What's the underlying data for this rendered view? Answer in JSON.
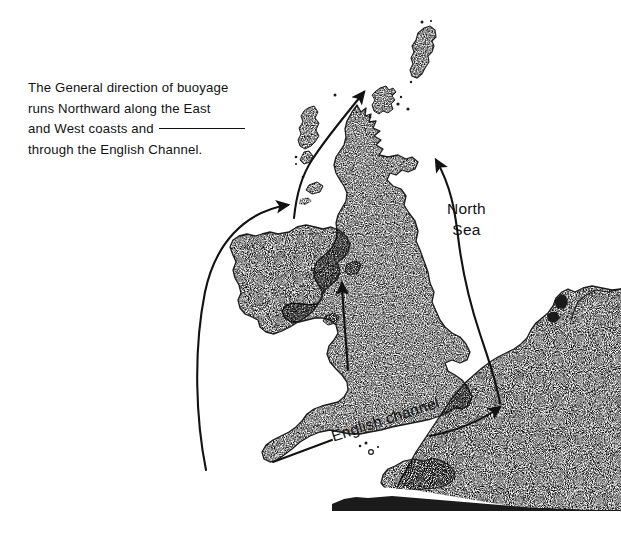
{
  "figure": {
    "background_color": "#ffffff",
    "ink_color": "#121212"
  },
  "caption": {
    "line1": "The General direction of buoyage",
    "line2": "runs Northward along the East",
    "line3_before_rule": "and West coasts and",
    "line4": "through the English Channel."
  },
  "map_labels": {
    "north_sea_line1": "North",
    "north_sea_line2": "Sea",
    "english_channel": "English channel"
  },
  "landmasses": [
    {
      "name": "shetland-islands",
      "label": "Shetland Islands"
    },
    {
      "name": "orkney-islands",
      "label": "Orkney Islands"
    },
    {
      "name": "outer-hebrides",
      "label": "Outer Hebrides"
    },
    {
      "name": "great-britain",
      "label": "Great Britain"
    },
    {
      "name": "ireland",
      "label": "Ireland"
    },
    {
      "name": "isle-of-man",
      "label": "Isle of Man"
    },
    {
      "name": "anglesey",
      "label": "Anglesey"
    },
    {
      "name": "channel-islands",
      "label": "Channel Islands"
    },
    {
      "name": "continental-europe",
      "label": "Continental Europe"
    }
  ],
  "arrows": [
    {
      "name": "west-coast-buoyage-arrow",
      "direction": "northward",
      "region": "Atlantic / west of Ireland and Scotland"
    },
    {
      "name": "irish-sea-buoyage-arrow",
      "direction": "northward",
      "region": "Irish Sea"
    },
    {
      "name": "north-sea-buoyage-arrow",
      "direction": "northward",
      "region": "North Sea / east coast"
    },
    {
      "name": "english-channel-buoyage-arrow",
      "direction": "eastward",
      "region": "English Channel"
    }
  ],
  "leader_line": {
    "name": "english-channel-leader-line"
  }
}
